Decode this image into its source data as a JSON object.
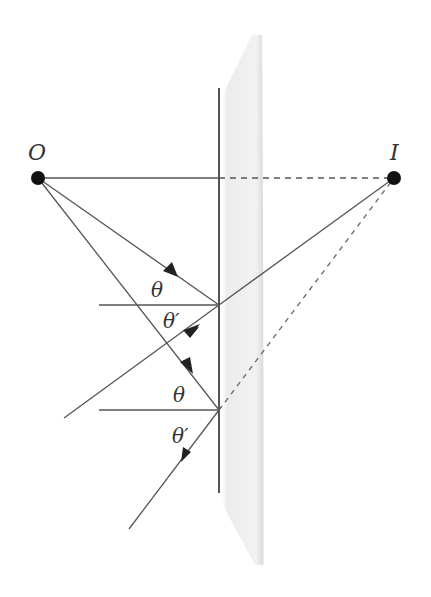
{
  "diagram": {
    "type": "plane-mirror-reflection",
    "labels": {
      "object": "O",
      "image": "I",
      "theta1": "θ",
      "theta1_prime": "θ′",
      "theta2": "θ",
      "theta2_prime": "θ′"
    },
    "colors": {
      "line": "#555555",
      "point": "#111111",
      "glass": "#e6e6e6"
    }
  }
}
